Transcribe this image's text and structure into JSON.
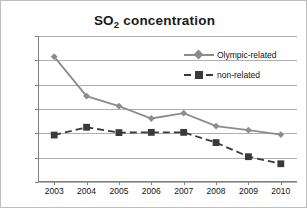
{
  "chart_data": {
    "type": "line",
    "title": "SO2 concentration",
    "title_main": "SO",
    "title_sub": "2",
    "title_rest": " concentration",
    "xlabel": "",
    "ylabel": "",
    "categories": [
      "2003",
      "2004",
      "2005",
      "2006",
      "2007",
      "2008",
      "2009",
      "2010"
    ],
    "ylim": [
      0.03,
      0.09
    ],
    "ytick_labels": [
      "0.090",
      "0.080",
      "0.070",
      "0.060",
      "0.050",
      "0.040",
      "0.030"
    ],
    "ytick_values": [
      0.09,
      0.08,
      0.07,
      0.06,
      0.05,
      0.04,
      0.03
    ],
    "grid": true,
    "legend_position": "top-right",
    "series": [
      {
        "name": "Olympic-related",
        "marker": "diamond",
        "linestyle": "solid",
        "color": "#8c8c8c",
        "values": [
          0.0815,
          0.0653,
          0.0612,
          0.0561,
          0.0583,
          0.053,
          0.0513,
          0.0495
        ]
      },
      {
        "name": "non-related",
        "marker": "square",
        "linestyle": "dashed",
        "color": "#3a3a3a",
        "values": [
          0.0493,
          0.0525,
          0.0503,
          0.0504,
          0.0504,
          0.0462,
          0.0404,
          0.0375
        ]
      }
    ]
  },
  "legend": {
    "items": [
      {
        "label": "Olympic-related"
      },
      {
        "label": "non-related"
      }
    ]
  },
  "colors": {
    "olympic": "#8c8c8c",
    "non_related": "#3a3a3a",
    "grid": "#b0b0b0",
    "axis": "#808080",
    "border": "#bdbdbd"
  }
}
